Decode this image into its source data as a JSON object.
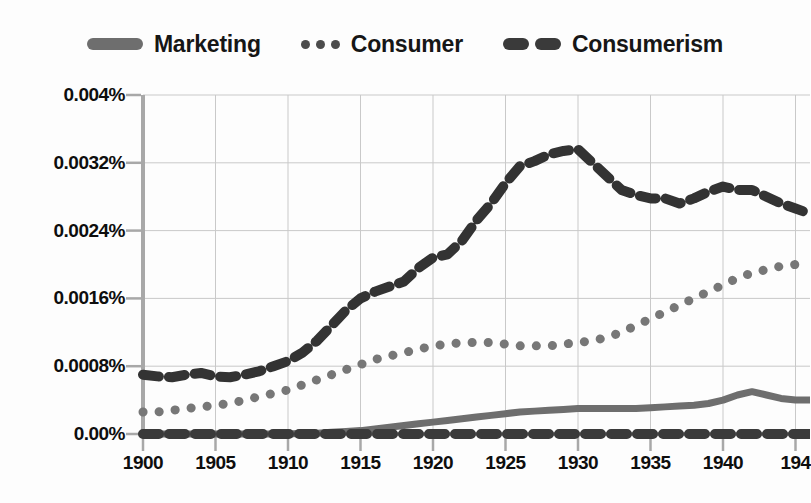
{
  "legend": {
    "position": "top-center",
    "entries": [
      {
        "label": "Marketing",
        "style": "solid",
        "color": "#6e6e6e"
      },
      {
        "label": "Consumer",
        "style": "dotted",
        "color": "#777777"
      },
      {
        "label": "Consumerism",
        "style": "dashed",
        "color": "#333333"
      }
    ]
  },
  "axes": {
    "y_tick_labels": [
      "0.004%",
      "0.0032%",
      "0.0024%",
      "0.0016%",
      "0.0008%",
      "0.00%"
    ],
    "x_tick_labels": [
      "1900",
      "1905",
      "1910",
      "1915",
      "1920",
      "1925",
      "1930",
      "1935",
      "1940",
      "194"
    ]
  },
  "colors": {
    "background": "#fdfdfd",
    "grid": "#c9c9c9",
    "axis": "#a8a8a8",
    "text": "#0e0e0e",
    "marketing": "#6e6e6e",
    "consumer": "#777777",
    "consumerism": "#333333",
    "baseline": "#3a3a3a"
  },
  "chart_data": {
    "type": "line",
    "title": "",
    "subtitle": "",
    "xlabel": "",
    "ylabel": "",
    "xlim": [
      1900,
      1946
    ],
    "ylim": [
      0.0,
      0.004
    ],
    "yunit": "%",
    "grid": true,
    "legend_position": "top-center",
    "note": "Google Ngram style frequency chart; y-axis labels are clipped at the left image edge, rightmost x tick label clipped to '194'",
    "x": [
      1900,
      1901,
      1902,
      1903,
      1904,
      1905,
      1906,
      1907,
      1908,
      1909,
      1910,
      1911,
      1912,
      1913,
      1914,
      1915,
      1916,
      1917,
      1918,
      1919,
      1920,
      1921,
      1922,
      1923,
      1924,
      1925,
      1926,
      1927,
      1928,
      1929,
      1930,
      1931,
      1932,
      1933,
      1934,
      1935,
      1936,
      1937,
      1938,
      1939,
      1940,
      1941,
      1942,
      1943,
      1944,
      1945,
      1946
    ],
    "series": [
      {
        "name": "Consumerism",
        "style": "dashed",
        "color": "#333333",
        "values": [
          0.0007,
          0.00068,
          0.00067,
          0.0007,
          0.00072,
          0.00068,
          0.00067,
          0.0007,
          0.00074,
          0.0008,
          0.00086,
          0.00096,
          0.0011,
          0.00128,
          0.00146,
          0.0016,
          0.00168,
          0.00174,
          0.0018,
          0.00196,
          0.00208,
          0.00212,
          0.00228,
          0.00252,
          0.00272,
          0.00296,
          0.00316,
          0.00322,
          0.0033,
          0.00334,
          0.00336,
          0.0032,
          0.00304,
          0.00288,
          0.00282,
          0.00278,
          0.00278,
          0.00272,
          0.00278,
          0.00286,
          0.00292,
          0.00288,
          0.00288,
          0.0028,
          0.00272,
          0.00266,
          0.0026
        ]
      },
      {
        "name": "Consumer",
        "style": "dotted",
        "color": "#777777",
        "values": [
          0.00026,
          0.00026,
          0.00028,
          0.0003,
          0.00032,
          0.00034,
          0.00036,
          0.0004,
          0.00044,
          0.00048,
          0.00052,
          0.00058,
          0.00064,
          0.0007,
          0.00076,
          0.00082,
          0.00088,
          0.00092,
          0.00096,
          0.001,
          0.00104,
          0.00106,
          0.00108,
          0.00108,
          0.00108,
          0.00106,
          0.00104,
          0.00104,
          0.00104,
          0.00106,
          0.00108,
          0.0011,
          0.00114,
          0.0012,
          0.00128,
          0.00136,
          0.00144,
          0.00152,
          0.0016,
          0.00168,
          0.00176,
          0.00184,
          0.0019,
          0.00194,
          0.00198,
          0.002,
          0.002
        ]
      },
      {
        "name": "Marketing",
        "style": "solid",
        "color": "#6e6e6e",
        "values": [
          0.0,
          0.0,
          0.0,
          0.0,
          0.0,
          0.0,
          0.0,
          0.0,
          0.0,
          0.0,
          0.0,
          1e-05,
          1e-05,
          2e-05,
          3e-05,
          4e-05,
          6e-05,
          8e-05,
          0.0001,
          0.00012,
          0.00014,
          0.00016,
          0.00018,
          0.0002,
          0.00022,
          0.00024,
          0.00026,
          0.00027,
          0.00028,
          0.00029,
          0.0003,
          0.0003,
          0.0003,
          0.0003,
          0.0003,
          0.00031,
          0.00032,
          0.00033,
          0.00034,
          0.00036,
          0.0004,
          0.00046,
          0.0005,
          0.00046,
          0.00042,
          0.0004,
          0.0004
        ]
      },
      {
        "name": "baseline",
        "style": "dashed",
        "color": "#3a3a3a",
        "values": [
          0.0,
          0.0,
          0.0,
          0.0,
          0.0,
          0.0,
          0.0,
          0.0,
          0.0,
          0.0,
          0.0,
          0.0,
          0.0,
          0.0,
          0.0,
          0.0,
          0.0,
          0.0,
          0.0,
          0.0,
          0.0,
          0.0,
          0.0,
          0.0,
          0.0,
          0.0,
          0.0,
          0.0,
          0.0,
          0.0,
          0.0,
          0.0,
          0.0,
          0.0,
          0.0,
          0.0,
          0.0,
          0.0,
          0.0,
          0.0,
          0.0,
          0.0,
          0.0,
          0.0,
          0.0,
          0.0,
          0.0
        ]
      }
    ]
  }
}
